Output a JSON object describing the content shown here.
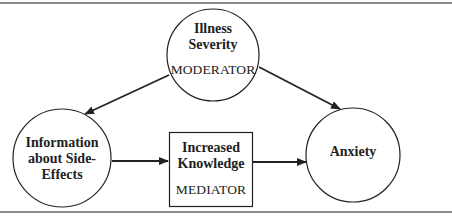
{
  "diagram": {
    "type": "mediation-moderation-model",
    "nodes": [
      {
        "id": "illness-severity",
        "shape": "circle",
        "title_lines": [
          "Illness",
          "Severity"
        ],
        "role": "MODERATOR"
      },
      {
        "id": "information-side-effects",
        "shape": "circle",
        "title_lines": [
          "Information",
          "about Side-",
          "Effects"
        ],
        "role": ""
      },
      {
        "id": "increased-knowledge",
        "shape": "rectangle",
        "title_lines": [
          "Increased",
          "Knowledge"
        ],
        "role": "MEDIATOR"
      },
      {
        "id": "anxiety",
        "shape": "circle",
        "title_lines": [
          "Anxiety"
        ],
        "role": ""
      }
    ],
    "edges": [
      {
        "from": "illness-severity",
        "to": "information-side-effects"
      },
      {
        "from": "illness-severity",
        "to": "anxiety"
      },
      {
        "from": "information-side-effects",
        "to": "increased-knowledge"
      },
      {
        "from": "increased-knowledge",
        "to": "anxiety"
      }
    ],
    "colors": {
      "stroke": "#222222",
      "frame": "#8a8a8a",
      "background": "#ffffff"
    }
  }
}
